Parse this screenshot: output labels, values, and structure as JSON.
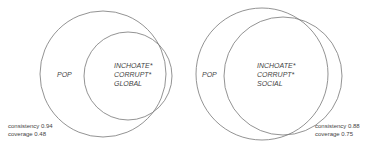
{
  "diagrams": [
    {
      "outer_label": "POP",
      "inner_label_lines": [
        "INCHOATE*",
        "CORRUPT*",
        "GLOBAL"
      ],
      "consistency": "consistency 0.94",
      "coverage": "coverage 0.48"
    },
    {
      "outer_label": "POP",
      "inner_label_lines": [
        "INCHOATE*",
        "CORRUPT*",
        "SOCIAL"
      ],
      "consistency": "consistency 0.88",
      "coverage": "coverage 0.75"
    }
  ],
  "colors": {
    "stroke": "#777777",
    "text": "#444444"
  }
}
